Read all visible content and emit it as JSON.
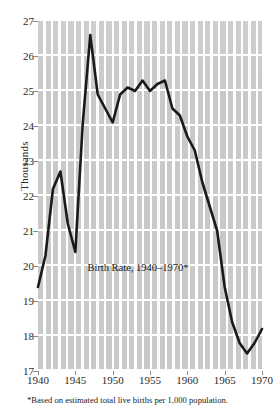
{
  "chart_data": {
    "type": "line",
    "title": "Birth Rate, 1940–1970*",
    "xlabel": "",
    "ylabel": "Thousands",
    "footnote": "*Based on estimated total live births per 1,000 population.",
    "xlim": [
      1940,
      1970
    ],
    "ylim": [
      17,
      27
    ],
    "grid": true,
    "legend": "none",
    "xticks": [
      1940,
      1945,
      1950,
      1955,
      1960,
      1965,
      1970
    ],
    "yticks": [
      17,
      18,
      19,
      20,
      21,
      22,
      23,
      24,
      25,
      26,
      27
    ],
    "series": [
      {
        "name": "Birth Rate",
        "color": "#1a1a1a",
        "x": [
          1940,
          1941,
          1942,
          1943,
          1944,
          1945,
          1946,
          1947,
          1948,
          1949,
          1950,
          1951,
          1952,
          1953,
          1954,
          1955,
          1956,
          1957,
          1958,
          1959,
          1960,
          1961,
          1962,
          1963,
          1964,
          1965,
          1966,
          1967,
          1968,
          1969,
          1970
        ],
        "values": [
          19.4,
          20.3,
          22.2,
          22.7,
          21.2,
          20.4,
          24.1,
          26.6,
          24.9,
          24.5,
          24.1,
          24.9,
          25.1,
          25.0,
          25.3,
          25.0,
          25.2,
          25.3,
          24.5,
          24.3,
          23.7,
          23.3,
          22.4,
          21.7,
          21.0,
          19.4,
          18.4,
          17.8,
          17.5,
          17.8,
          18.2
        ]
      }
    ]
  },
  "axis": {
    "y_title": "Thousands",
    "y_tick_labels": [
      "27",
      "26",
      "25",
      "24",
      "23",
      "22",
      "21",
      "20",
      "19",
      "18",
      "17"
    ],
    "x_tick_labels": [
      "1940",
      "1945",
      "1950",
      "1955",
      "1960",
      "1965",
      "1970"
    ]
  },
  "annotation": {
    "title": "Birth Rate, 1940–1970*"
  },
  "note": {
    "text": "*Based on estimated total live births per 1,000 population."
  }
}
